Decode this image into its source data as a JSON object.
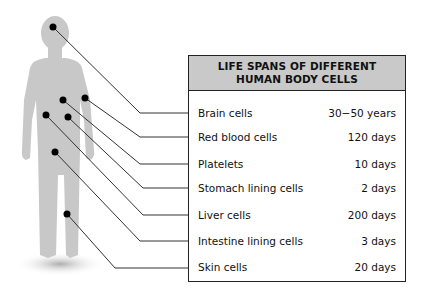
{
  "table": {
    "title_line1": "LIFE SPANS OF DIFFERENT",
    "title_line2": "HUMAN BODY CELLS",
    "header_color": "#c9c9c9",
    "rows": [
      {
        "cell": "Brain cells",
        "lifespan": "30−50 years"
      },
      {
        "cell": "Red blood cells",
        "lifespan": "120 days"
      },
      {
        "cell": "Platelets",
        "lifespan": "10 days"
      },
      {
        "cell": "Stomach lining cells",
        "lifespan": "2 days"
      },
      {
        "cell": "Liver cells",
        "lifespan": "200 days"
      },
      {
        "cell": "Intestine lining cells",
        "lifespan": "3 days"
      },
      {
        "cell": "Skin cells",
        "lifespan": "20 days"
      }
    ]
  },
  "figure": {
    "body_color": "#c8c8c8"
  }
}
